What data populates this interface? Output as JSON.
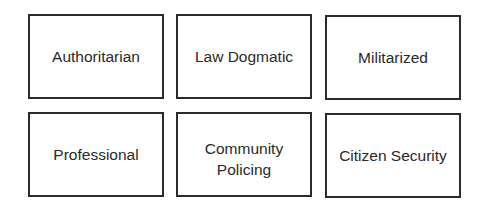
{
  "diagram": {
    "rows": [
      {
        "boxes": [
          {
            "label": "Authoritarian"
          },
          {
            "label": "Law Dogmatic"
          },
          {
            "label": "Militarized"
          }
        ]
      },
      {
        "boxes": [
          {
            "label": "Professional"
          },
          {
            "label": "Community Policing",
            "lines": [
              "Community",
              "Policing"
            ]
          },
          {
            "label": "Citizen Security"
          }
        ]
      }
    ]
  }
}
